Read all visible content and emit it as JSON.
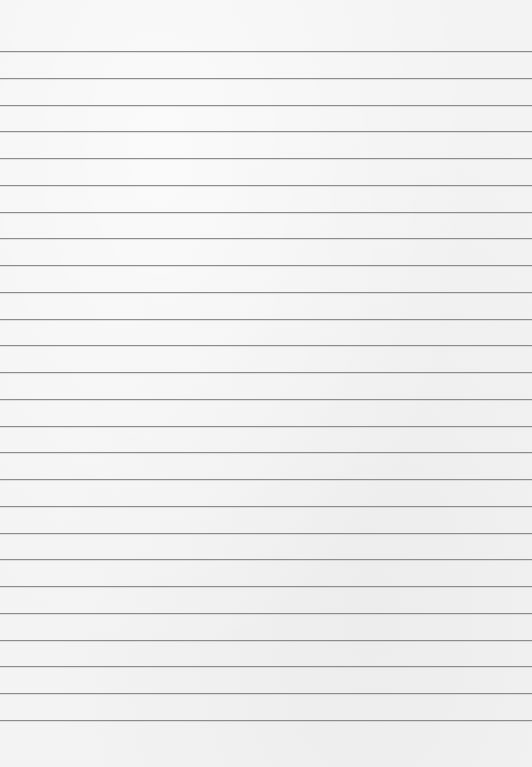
{
  "paper": {
    "background_color": "#f3f3f3",
    "line_color": "#8c8c8c",
    "line_count": 26,
    "first_line_y": 51,
    "line_spacing": 26.76
  }
}
